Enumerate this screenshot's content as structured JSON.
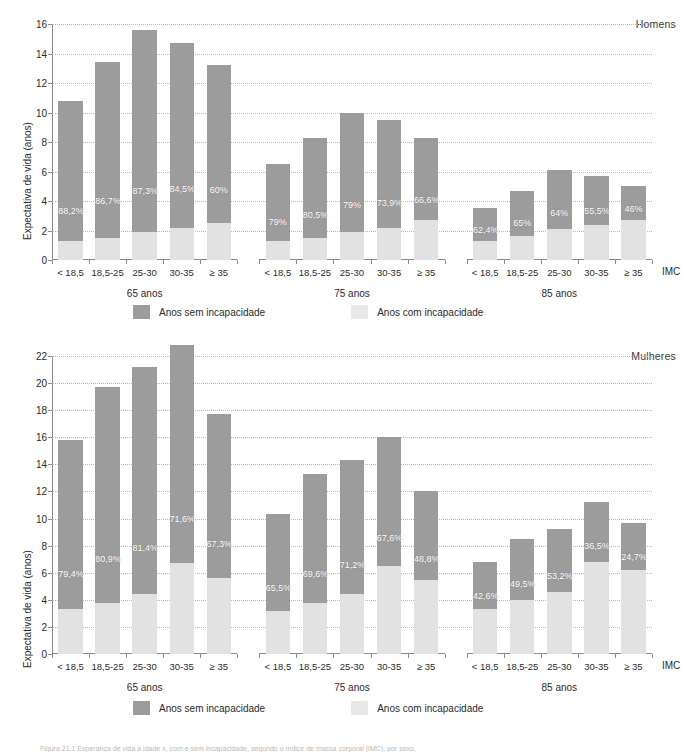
{
  "figure": {
    "caption": "Figura 21.1 Esperança de vida à idade x, com e sem incapacidade, segundo o índice de massa corporal (IMC), por sexo."
  },
  "legend": {
    "items": [
      {
        "label": "Anos sem incapacidade",
        "color": "#9c9c9c",
        "key": "sem"
      },
      {
        "label": "Anos com incapacidade",
        "color": "#e8e8e8",
        "key": "com"
      }
    ]
  },
  "axis": {
    "ylabel": "Expectativa de vida (anos)",
    "xlabel": "IMC",
    "categories": [
      "< 18,5",
      "18,5-25",
      "25-30",
      "30-35",
      "≥ 35"
    ],
    "groups": [
      "65 anos",
      "75 anos",
      "85 anos"
    ]
  },
  "chart_data": [
    {
      "type": "bar",
      "title": "Homens",
      "subtitle": "",
      "xlabel": "IMC",
      "ylabel": "Expectativa de vida (anos)",
      "ylim": [
        0,
        16
      ],
      "yticks": [
        0,
        2,
        4,
        6,
        8,
        10,
        12,
        14,
        16
      ],
      "grid": true,
      "legend_position": "bottom",
      "categories": [
        "< 18,5",
        "18,5-25",
        "25-30",
        "30-35",
        "≥ 35"
      ],
      "groups": [
        {
          "name": "65 anos",
          "bars": [
            {
              "category": "< 18,5",
              "total": 10.8,
              "com_incapacidade": 1.3,
              "sem_incapacidade": 9.5,
              "pct_sem": "88,2%"
            },
            {
              "category": "18,5-25",
              "total": 13.4,
              "com_incapacidade": 1.5,
              "sem_incapacidade": 11.9,
              "pct_sem": "86,7%"
            },
            {
              "category": "25-30",
              "total": 15.6,
              "com_incapacidade": 1.9,
              "sem_incapacidade": 13.7,
              "pct_sem": "87,3%"
            },
            {
              "category": "30-35",
              "total": 14.7,
              "com_incapacidade": 2.2,
              "sem_incapacidade": 12.5,
              "pct_sem": "84,5%"
            },
            {
              "category": "≥ 35",
              "total": 13.2,
              "com_incapacidade": 2.5,
              "sem_incapacidade": 10.7,
              "pct_sem": "60%"
            }
          ]
        },
        {
          "name": "75 anos",
          "bars": [
            {
              "category": "< 18,5",
              "total": 6.5,
              "com_incapacidade": 1.3,
              "sem_incapacidade": 5.2,
              "pct_sem": "79%"
            },
            {
              "category": "18,5-25",
              "total": 8.3,
              "com_incapacidade": 1.5,
              "sem_incapacidade": 6.8,
              "pct_sem": "80,5%"
            },
            {
              "category": "25-30",
              "total": 10.0,
              "com_incapacidade": 1.9,
              "sem_incapacidade": 8.1,
              "pct_sem": "79%"
            },
            {
              "category": "30-35",
              "total": 9.5,
              "com_incapacidade": 2.2,
              "sem_incapacidade": 7.3,
              "pct_sem": "73,9%"
            },
            {
              "category": "≥ 35",
              "total": 8.3,
              "com_incapacidade": 2.7,
              "sem_incapacidade": 5.6,
              "pct_sem": "66,6%"
            }
          ]
        },
        {
          "name": "85 anos",
          "bars": [
            {
              "category": "< 18,5",
              "total": 3.5,
              "com_incapacidade": 1.3,
              "sem_incapacidade": 2.2,
              "pct_sem": "62,4%"
            },
            {
              "category": "18,5-25",
              "total": 4.7,
              "com_incapacidade": 1.6,
              "sem_incapacidade": 3.1,
              "pct_sem": "65%"
            },
            {
              "category": "25-30",
              "total": 6.1,
              "com_incapacidade": 2.1,
              "sem_incapacidade": 4.0,
              "pct_sem": "64%"
            },
            {
              "category": "30-35",
              "total": 5.7,
              "com_incapacidade": 2.4,
              "sem_incapacidade": 3.3,
              "pct_sem": "55,5%"
            },
            {
              "category": "≥ 35",
              "total": 5.0,
              "com_incapacidade": 2.7,
              "sem_incapacidade": 2.3,
              "pct_sem": "46%"
            }
          ]
        }
      ]
    },
    {
      "type": "bar",
      "title": "Mulheres",
      "subtitle": "",
      "xlabel": "IMC",
      "ylabel": "Expectativa de vida (anos)",
      "ylim": [
        0,
        22
      ],
      "yticks": [
        0,
        2,
        4,
        6,
        8,
        10,
        12,
        14,
        16,
        18,
        20,
        22
      ],
      "grid": true,
      "legend_position": "bottom",
      "categories": [
        "< 18,5",
        "18,5-25",
        "25-30",
        "30-35",
        "≥ 35"
      ],
      "groups": [
        {
          "name": "65 anos",
          "bars": [
            {
              "category": "< 18,5",
              "total": 15.8,
              "com_incapacidade": 3.3,
              "sem_incapacidade": 12.5,
              "pct_sem": "79,4%"
            },
            {
              "category": "18,5-25",
              "total": 19.7,
              "com_incapacidade": 3.8,
              "sem_incapacidade": 15.9,
              "pct_sem": "80,9%"
            },
            {
              "category": "25-30",
              "total": 21.2,
              "com_incapacidade": 4.4,
              "sem_incapacidade": 16.8,
              "pct_sem": "81,4%"
            },
            {
              "category": "30-35",
              "total": 22.8,
              "com_incapacidade": 6.7,
              "sem_incapacidade": 16.1,
              "pct_sem": "71,6%"
            },
            {
              "category": "≥ 35",
              "total": 17.7,
              "com_incapacidade": 5.6,
              "sem_incapacidade": 12.1,
              "pct_sem": "67,3%"
            }
          ]
        },
        {
          "name": "75 anos",
          "bars": [
            {
              "category": "< 18,5",
              "total": 10.3,
              "com_incapacidade": 3.2,
              "sem_incapacidade": 7.1,
              "pct_sem": "65,5%"
            },
            {
              "category": "18,5-25",
              "total": 13.3,
              "com_incapacidade": 3.8,
              "sem_incapacidade": 9.5,
              "pct_sem": "69,6%"
            },
            {
              "category": "25-30",
              "total": 14.3,
              "com_incapacidade": 4.4,
              "sem_incapacidade": 9.9,
              "pct_sem": "71,2%"
            },
            {
              "category": "30-35",
              "total": 16.0,
              "com_incapacidade": 6.5,
              "sem_incapacidade": 9.5,
              "pct_sem": "67,6%"
            },
            {
              "category": "≥ 35",
              "total": 12.0,
              "com_incapacidade": 5.5,
              "sem_incapacidade": 6.5,
              "pct_sem": "48,8%"
            }
          ]
        },
        {
          "name": "85 anos",
          "bars": [
            {
              "category": "< 18,5",
              "total": 6.8,
              "com_incapacidade": 3.3,
              "sem_incapacidade": 3.5,
              "pct_sem": "42,6%"
            },
            {
              "category": "18,5-25",
              "total": 8.5,
              "com_incapacidade": 4.0,
              "sem_incapacidade": 4.5,
              "pct_sem": "49,5%"
            },
            {
              "category": "25-30",
              "total": 9.2,
              "com_incapacidade": 4.6,
              "sem_incapacidade": 4.6,
              "pct_sem": "53,2%"
            },
            {
              "category": "30-35",
              "total": 11.2,
              "com_incapacidade": 6.8,
              "sem_incapacidade": 4.4,
              "pct_sem": "36,5%"
            },
            {
              "category": "≥ 35",
              "total": 9.7,
              "com_incapacidade": 6.2,
              "sem_incapacidade": 3.5,
              "pct_sem": "24,7%"
            }
          ]
        }
      ]
    }
  ]
}
